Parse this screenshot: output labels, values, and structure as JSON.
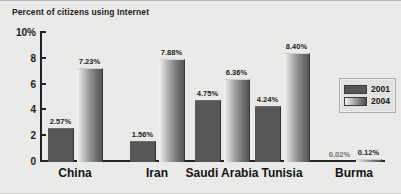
{
  "chart_data": {
    "type": "bar",
    "title": "Percent of citizens using Internet",
    "xlabel": "",
    "ylabel": "",
    "ylim": [
      0,
      10
    ],
    "yticks": [
      "0",
      "2",
      "4",
      "6",
      "8",
      "10%"
    ],
    "grid": false,
    "legend_position": "right",
    "categories": [
      "China",
      "Iran",
      "Saudi Arabia",
      "Tunisia",
      "Burma"
    ],
    "series": [
      {
        "name": "2001",
        "color": "#575757",
        "values": [
          2.57,
          1.56,
          4.75,
          4.24,
          0.02
        ],
        "labels": [
          "2.57%",
          "1.56%",
          "4.75%",
          "4.24%",
          "0.02%"
        ]
      },
      {
        "name": "2004",
        "color": "#9a9a98",
        "values": [
          7.23,
          7.88,
          6.36,
          8.4,
          0.12
        ],
        "labels": [
          "7.23%",
          "7.88%",
          "6.36%",
          "8.40%",
          "0.12%"
        ]
      }
    ]
  },
  "legend": {
    "items": [
      {
        "label": "2001"
      },
      {
        "label": "2004"
      }
    ]
  }
}
